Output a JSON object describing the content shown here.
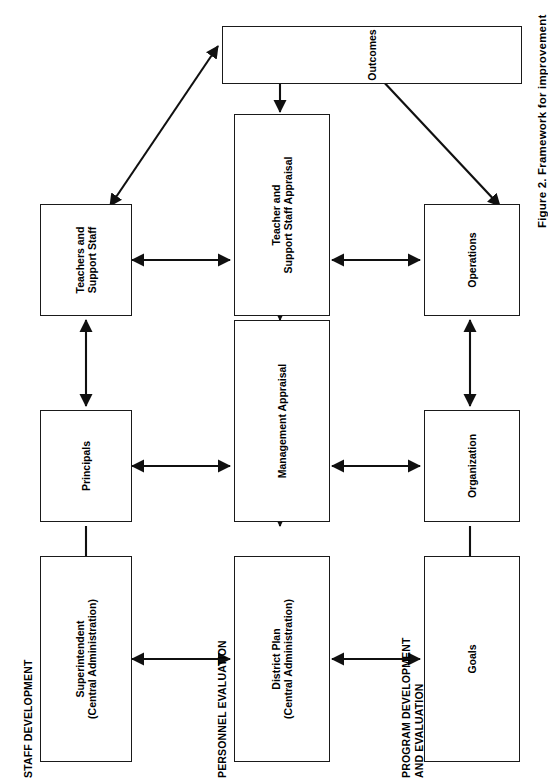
{
  "figure": {
    "caption": "Figure 2.  Framework for improvement",
    "type": "flow-diagram",
    "orientation": "rotated-90-ccw",
    "background_color": "#ffffff",
    "line_color": "#101010"
  },
  "bands": [
    {
      "id": "staff-development",
      "label": "STAFF DEVELOPMENT"
    },
    {
      "id": "personnel-evaluation",
      "label": "PERSONNEL EVALUATION"
    },
    {
      "id": "program-development",
      "label": "PROGRAM DEVELOPMENT\nAND EVALUATION"
    }
  ],
  "nodes": [
    {
      "id": "superintendent",
      "label": "Superintendent\n(Central Administration)",
      "band": "staff-development"
    },
    {
      "id": "principals",
      "label": "Principals",
      "band": "staff-development"
    },
    {
      "id": "teachers-support",
      "label": "Teachers and\nSupport Staff",
      "band": "staff-development"
    },
    {
      "id": "district-plan",
      "label": "District Plan\n(Central Administration)",
      "band": "personnel-evaluation"
    },
    {
      "id": "management-appraisal",
      "label": "Management Appraisal",
      "band": "personnel-evaluation"
    },
    {
      "id": "teacher-staff-appraisal",
      "label": "Teacher and\nSupport Staff Appraisal",
      "band": "personnel-evaluation"
    },
    {
      "id": "goals",
      "label": "Goals",
      "band": "program-development"
    },
    {
      "id": "organization",
      "label": "Organization",
      "band": "program-development"
    },
    {
      "id": "operations",
      "label": "Operations",
      "band": "program-development"
    },
    {
      "id": "outcomes",
      "label": "Outcomes",
      "band": "outcomes"
    }
  ],
  "connections": [
    {
      "from": "principals",
      "to": "superintendent",
      "style": "single"
    },
    {
      "from": "principals",
      "to": "teachers-support",
      "style": "double"
    },
    {
      "from": "superintendent",
      "to": "district-plan",
      "style": "double"
    },
    {
      "from": "principals",
      "to": "management-appraisal",
      "style": "double"
    },
    {
      "from": "teachers-support",
      "to": "teacher-staff-appraisal",
      "style": "double"
    },
    {
      "from": "district-plan",
      "to": "management-appraisal",
      "style": "double"
    },
    {
      "from": "management-appraisal",
      "to": "teacher-staff-appraisal",
      "style": "double"
    },
    {
      "from": "teacher-staff-appraisal",
      "to": "outcomes",
      "style": "double"
    },
    {
      "from": "district-plan",
      "to": "goals",
      "style": "double"
    },
    {
      "from": "management-appraisal",
      "to": "organization",
      "style": "double"
    },
    {
      "from": "teacher-staff-appraisal",
      "to": "operations",
      "style": "double"
    },
    {
      "from": "organization",
      "to": "goals",
      "style": "single"
    },
    {
      "from": "organization",
      "to": "operations",
      "style": "double"
    },
    {
      "from": "teachers-support",
      "to": "outcomes",
      "style": "double-diagonal"
    },
    {
      "from": "operations",
      "to": "outcomes",
      "style": "double-diagonal"
    }
  ]
}
